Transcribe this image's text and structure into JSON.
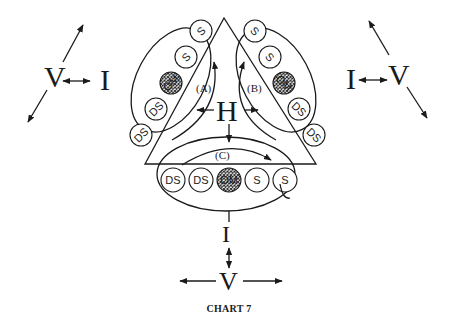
{
  "figure": {
    "caption": "CHART 7",
    "center_label": "H",
    "loops": [
      {
        "id": "A",
        "label": "(A)"
      },
      {
        "id": "B",
        "label": "(B)"
      },
      {
        "id": "C",
        "label": "(C)"
      }
    ],
    "side_left": {
      "v_label": "V",
      "i_label": "I"
    },
    "side_right": {
      "v_label": "V",
      "i_label": "I"
    },
    "side_bottom": {
      "v_label": "V",
      "i_label": "I"
    },
    "chains": {
      "left": [
        "S",
        "S",
        "OM",
        "DS",
        "DS"
      ],
      "right": [
        "S",
        "S",
        "OM",
        "DS",
        "DS"
      ],
      "bottom": [
        "DS",
        "DS",
        "OM",
        "S",
        "S"
      ]
    }
  }
}
